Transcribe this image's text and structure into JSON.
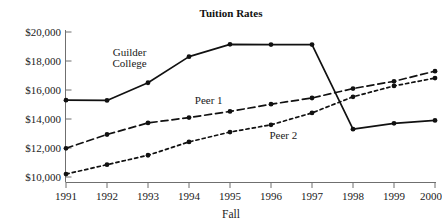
{
  "chart_data": {
    "type": "line",
    "title": "Tuition Rates",
    "xlabel": "Fall",
    "ylabel": "",
    "categories": [
      "1991",
      "1992",
      "1993",
      "1994",
      "1995",
      "1996",
      "1997",
      "1998",
      "1999",
      "2000"
    ],
    "x": [
      1991,
      1992,
      1993,
      1994,
      1995,
      1996,
      1997,
      1998,
      1999,
      2000
    ],
    "ylim": [
      10000,
      20000
    ],
    "ytick_values": [
      10000,
      12000,
      14000,
      16000,
      18000,
      20000
    ],
    "ytick_labels": [
      "$10,000",
      "$12,000",
      "$14,000",
      "$16,000",
      "$18,000",
      "$20,000"
    ],
    "grid": false,
    "legend": "inline-annotations",
    "series": [
      {
        "name": "Guilder College",
        "style": "solid",
        "values": [
          15300,
          15280,
          16500,
          18300,
          19150,
          19130,
          19130,
          13300,
          13700,
          13900
        ]
      },
      {
        "name": "Peer 1",
        "style": "long-dash",
        "values": [
          11980,
          12930,
          13730,
          14100,
          14520,
          15020,
          15450,
          16100,
          16600,
          17300
        ]
      },
      {
        "name": "Peer 2",
        "style": "short-dash",
        "values": [
          10200,
          10850,
          11500,
          12420,
          13100,
          13600,
          14420,
          15530,
          16280,
          16820
        ]
      }
    ],
    "annotations": [
      {
        "text": "Guilder",
        "series": "Guilder College",
        "x": 1992.55,
        "y": 18650
      },
      {
        "text": "College",
        "series": "Guilder College",
        "x": 1992.55,
        "y": 17830
      },
      {
        "text": "Peer 1",
        "series": "Peer 1",
        "x": 1994.48,
        "y": 15330
      },
      {
        "text": "Peer 2",
        "series": "Peer 2",
        "x": 1996.3,
        "y": 12870
      }
    ]
  }
}
